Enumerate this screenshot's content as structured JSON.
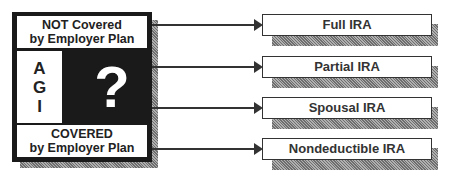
{
  "left_box": {
    "top_label_line1": "NOT Covered",
    "top_label_line2": "by Employer Plan",
    "agi_letters": [
      "A",
      "G",
      "I"
    ],
    "center_symbol": "?",
    "bottom_label_line1": "COVERED",
    "bottom_label_line2": "by Employer Plan"
  },
  "outcomes": [
    {
      "label": "Full IRA"
    },
    {
      "label": "Partial IRA"
    },
    {
      "label": "Spousal IRA"
    },
    {
      "label": "Nondeductible IRA"
    }
  ],
  "colors": {
    "box_fill": "#1a1a1a",
    "shadow": "#8a8a8a",
    "line": "#333333"
  }
}
